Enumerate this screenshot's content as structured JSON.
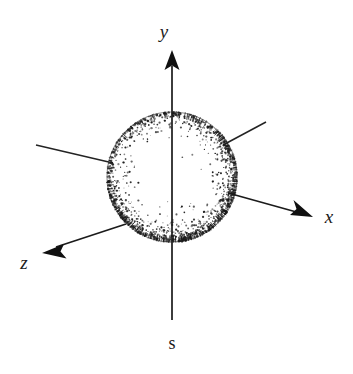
{
  "figure": {
    "kind": "3d-coordinate-axes-with-stippled-sphere",
    "background_color": "#ffffff",
    "ink_color": "#1b1b1b",
    "width": 353,
    "height": 374
  },
  "labels": {
    "y_axis": "y",
    "x_axis": "x",
    "z_axis": "z",
    "bottom_axis": "s"
  },
  "chart_data": {
    "type": "scatter",
    "title": "",
    "xlabel": "x",
    "ylabel": "y",
    "zlabel": "z",
    "grid": false,
    "legend": false,
    "origin": {
      "x": 172,
      "y": 177
    },
    "sphere": {
      "center_x": 172,
      "center_y": 177,
      "radius": 65,
      "shading": "stippled, dense at rim and lower-right, sparse at upper-left center",
      "stipple_count": 1500,
      "light_direction": "upper-left"
    },
    "axes": [
      {
        "name": "y",
        "label": "y",
        "from": {
          "x": 172,
          "y": 177
        },
        "to": {
          "x": 172,
          "y": 52
        },
        "arrow": true,
        "label_pos": {
          "x": 165,
          "y": 36
        }
      },
      {
        "name": "s",
        "label": "s",
        "from": {
          "x": 172,
          "y": 177
        },
        "to": {
          "x": 172,
          "y": 320
        },
        "arrow": false,
        "label_pos": {
          "x": 166,
          "y": 348
        }
      },
      {
        "name": "x",
        "label": "x",
        "from": {
          "x": 172,
          "y": 177
        },
        "to": {
          "x": 312,
          "y": 216
        },
        "arrow": true,
        "label_pos": {
          "x": 324,
          "y": 222
        }
      },
      {
        "name": "x-negative",
        "label": "",
        "from": {
          "x": 172,
          "y": 177
        },
        "to": {
          "x": 36,
          "y": 145
        },
        "arrow": false,
        "label_pos": null
      },
      {
        "name": "z",
        "label": "z",
        "from": {
          "x": 172,
          "y": 177
        },
        "to": {
          "x": 44,
          "y": 252
        },
        "arrow": true,
        "label_pos": {
          "x": 20,
          "y": 268
        }
      },
      {
        "name": "z-negative",
        "label": "",
        "from": {
          "x": 172,
          "y": 177
        },
        "to": {
          "x": 266,
          "y": 122
        },
        "arrow": false,
        "label_pos": null
      }
    ]
  }
}
